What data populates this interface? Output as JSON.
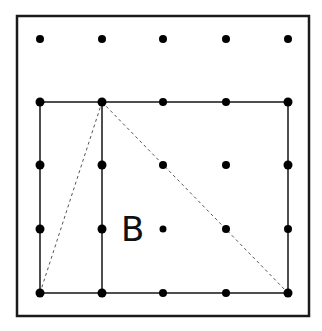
{
  "diagram": {
    "type": "geoboard",
    "grid": {
      "cols": 5,
      "rows": 5,
      "x": [
        40,
        102,
        163,
        226,
        288
      ],
      "y": [
        39,
        102,
        165,
        229,
        293
      ]
    },
    "frame": {
      "x": 17,
      "y": 16,
      "width": 292,
      "height": 300
    },
    "rectangle": {
      "from": [
        0,
        1
      ],
      "to": [
        4,
        4
      ]
    },
    "divider": {
      "col": 1,
      "from_row": 1,
      "to_row": 4
    },
    "dashed_triangle": [
      [
        0,
        4
      ],
      [
        1,
        1
      ],
      [
        4,
        4
      ]
    ],
    "label": "B",
    "colors": {
      "line": "#1a1a1a",
      "dot": "#000000",
      "dashed": "#555555"
    }
  }
}
